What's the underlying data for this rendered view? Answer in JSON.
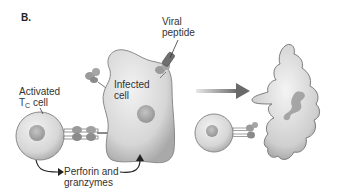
{
  "panel": {
    "letter": "B."
  },
  "labels": {
    "viral_peptide_line1": "Viral",
    "viral_peptide_line2": "peptide",
    "infected_cell_line1": "Infected",
    "infected_cell_line2": "cell",
    "tc_cell_line1": "Activated",
    "tc_cell_T": "T",
    "tc_cell_sub": "C",
    "tc_cell_suffix": " cell",
    "perforin_line1": "Perforin and",
    "perforin_line2": "granzymes"
  },
  "colors": {
    "cell_fill": "#d9d9d9",
    "cell_stroke": "#8a8a8a",
    "nucleus": "#a8a8a8",
    "arrow": "#6e6e6e",
    "receptor": "#9a9a9a",
    "text": "#333333"
  }
}
